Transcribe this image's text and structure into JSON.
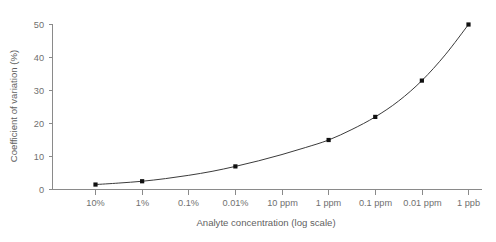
{
  "chart_data": {
    "type": "line",
    "title": "",
    "xlabel": "Analyte concentration (log scale)",
    "ylabel": "Coefficient of variation (%)",
    "categories": [
      "10%",
      "1%",
      "0.1%",
      "0.01%",
      "10 ppm",
      "1 ppm",
      "0.1 ppm",
      "0.01 ppm",
      "1 ppb"
    ],
    "x_tick_labels": [
      "10%",
      "1%",
      "0.1%",
      "0.01%",
      "10 ppm",
      "1 ppm",
      "0.1 ppm",
      "0.01 ppm",
      "1 ppb"
    ],
    "y_tick_labels": [
      "0",
      "10",
      "20",
      "30",
      "40",
      "50"
    ],
    "y_ticks": [
      0,
      10,
      20,
      30,
      40,
      50
    ],
    "ylim": [
      0,
      50
    ],
    "xlim": [
      0,
      8
    ],
    "grid": false,
    "legend": false,
    "series": [
      {
        "name": "Coefficient of variation",
        "marker": "square",
        "marker_color": "#111111",
        "line_color": "#3b3b3b",
        "points": [
          {
            "x_index": 0,
            "x_label": "10%",
            "y": 1.5
          },
          {
            "x_index": 1,
            "x_label": "1%",
            "y": 2.5
          },
          {
            "x_index": 3,
            "x_label": "0.01%",
            "y": 7
          },
          {
            "x_index": 5,
            "x_label": "1 ppm",
            "y": 15
          },
          {
            "x_index": 6,
            "x_label": "0.1 ppm",
            "y": 22
          },
          {
            "x_index": 7,
            "x_label": "0.01 ppm",
            "y": 33
          },
          {
            "x_index": 8,
            "x_label": "1 ppb",
            "y": 50
          }
        ],
        "curve_points": [
          {
            "x_index": 0,
            "y": 1.5
          },
          {
            "x_index": 0.5,
            "y": 1.95
          },
          {
            "x_index": 1,
            "y": 2.5
          },
          {
            "x_index": 1.5,
            "y": 3.3
          },
          {
            "x_index": 2,
            "y": 4.3
          },
          {
            "x_index": 2.5,
            "y": 5.5
          },
          {
            "x_index": 3,
            "y": 7.0
          },
          {
            "x_index": 3.5,
            "y": 8.7
          },
          {
            "x_index": 4,
            "y": 10.6
          },
          {
            "x_index": 4.5,
            "y": 12.7
          },
          {
            "x_index": 5,
            "y": 15.0
          },
          {
            "x_index": 5.5,
            "y": 18.2
          },
          {
            "x_index": 6,
            "y": 22.0
          },
          {
            "x_index": 6.5,
            "y": 26.8
          },
          {
            "x_index": 7,
            "y": 33.0
          },
          {
            "x_index": 7.5,
            "y": 40.8
          },
          {
            "x_index": 8,
            "y": 50.0
          }
        ]
      }
    ]
  },
  "colors": {
    "axis": "#8a8a8a",
    "tick_text": "#6f6f6f",
    "title_text": "#5f5f5f",
    "line": "#3b3b3b",
    "marker": "#111111",
    "background": "#ffffff"
  }
}
